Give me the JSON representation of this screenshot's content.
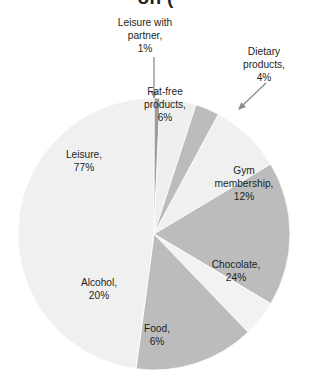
{
  "title": {
    "text": "on (",
    "note": "title clipped at top edge of screenshot"
  },
  "chart_data": {
    "type": "pie",
    "title": "on (",
    "xlabel": "",
    "ylabel": "",
    "legend_position": "none",
    "grid": false,
    "labels_on_slices": true,
    "categories": [
      "Leisure with partner",
      "Fat-free products",
      "Dietary products",
      "Gym membership",
      "Chocolate",
      "Food",
      "Alcohol",
      "Leisure"
    ],
    "values": [
      1,
      6,
      4,
      12,
      24,
      6,
      20,
      77
    ],
    "value_labels": [
      "1%",
      "6%",
      "4%",
      "12%",
      "24%",
      "6%",
      "20%",
      "77%"
    ],
    "colors": [
      "#9e9e9e",
      "#efefef",
      "#bcbcbc",
      "#f0f0f0",
      "#bcbcbc",
      "#f2f2f2",
      "#bcbcbc",
      "#f0f0f0"
    ],
    "slices": [
      {
        "name": "Leisure with partner",
        "value": 1,
        "label": "Leisure with\npartner,\n1%",
        "color": "#9e9e9e",
        "start_deg": 0,
        "end_deg": 2.57,
        "callout": true
      },
      {
        "name": "Fat-free products",
        "value": 6,
        "label": "Fat-free\nproducts,\n6%",
        "color": "#efefef",
        "start_deg": 2.57,
        "end_deg": 18.0,
        "callout": false
      },
      {
        "name": "Dietary products",
        "value": 4,
        "label": "Dietary\nproducts,\n4%",
        "color": "#bcbcbc",
        "start_deg": 18.0,
        "end_deg": 28.3,
        "callout": true
      },
      {
        "name": "Gym membership",
        "value": 12,
        "label": "Gym\nmembership,\n12%",
        "color": "#f0f0f0",
        "start_deg": 28.3,
        "end_deg": 59.1,
        "callout": false
      },
      {
        "name": "Chocolate",
        "value": 24,
        "label": "Chocolate,\n24%",
        "color": "#bcbcbc",
        "start_deg": 59.1,
        "end_deg": 120.8,
        "callout": false
      },
      {
        "name": "Food",
        "value": 6,
        "label": "Food,\n6%",
        "color": "#f2f2f2",
        "start_deg": 120.8,
        "end_deg": 136.2,
        "callout": false
      },
      {
        "name": "Alcohol",
        "value": 20,
        "label": "Alcohol,\n20%",
        "color": "#bcbcbc",
        "start_deg": 136.2,
        "end_deg": 187.6,
        "callout": false
      },
      {
        "name": "Leisure",
        "value": 77,
        "label": "Leisure,\n77%",
        "color": "#f0f0f0",
        "start_deg": 187.6,
        "end_deg": 360.0,
        "callout": false
      }
    ],
    "total_shown": 150,
    "annotations": [
      {
        "name": "leisure-with-partner-arrow",
        "direction": "down"
      },
      {
        "name": "dietary-products-arrow",
        "direction": "down-left"
      }
    ]
  },
  "geometry": {
    "center_x": 154,
    "center_y": 234,
    "radius": 136
  }
}
